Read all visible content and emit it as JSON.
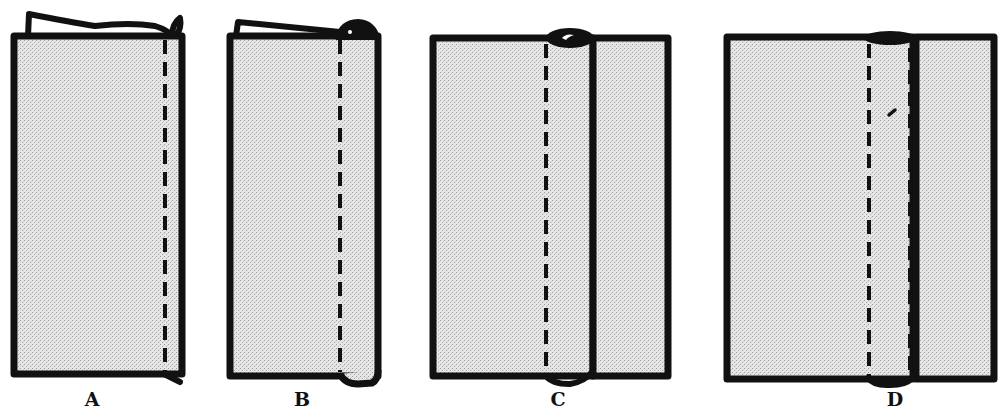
{
  "diagram": {
    "colors": {
      "outline": "#111111",
      "fabric_fill": "#e3e3e3",
      "background": "#ffffff"
    },
    "panels": [
      {
        "id": "A",
        "label": "A",
        "description": "Fabric with edge folded over; single stitching line near right edge",
        "label_x": 92
      },
      {
        "id": "B",
        "label": "B",
        "description": "Edge rolled with fold at top right; single stitching line",
        "label_x": 302
      },
      {
        "id": "C",
        "label": "C",
        "description": "Fabric opened flat with rolled seam and separate right panel; one stitching line",
        "label_x": 558
      },
      {
        "id": "D",
        "label": "D",
        "description": "Flat-felled seam with two stitching lines and separate right panel",
        "label_x": 895
      }
    ]
  }
}
